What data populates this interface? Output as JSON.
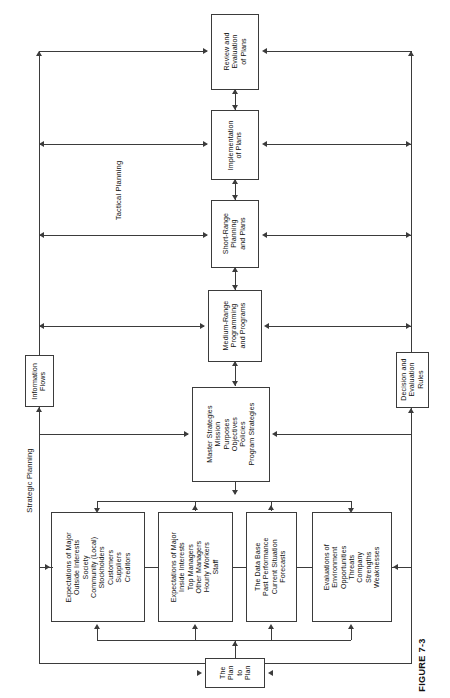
{
  "figure": {
    "caption": "FIGURE 7-3",
    "orientation": "rotated-90",
    "ink_color": "#3b3b3b"
  },
  "section_labels": {
    "tactical": "Tactical Planning",
    "strategic": "Strategic Planning"
  },
  "side_boxes": {
    "information_flows": {
      "lines": [
        "Information",
        "Flows"
      ]
    },
    "decision_rules": {
      "lines": [
        "Decision and",
        "Evaluation",
        "Rules"
      ]
    }
  },
  "spine_boxes": [
    {
      "id": "review-evaluation-of-plans",
      "lines": [
        "Review and",
        "Evaluation",
        "of Plans"
      ]
    },
    {
      "id": "implementation-of-plans",
      "lines": [
        "Implementation",
        "of Plans"
      ]
    },
    {
      "id": "short-range-planning-and-plans",
      "lines": [
        "Short-Range",
        "Planning",
        "and Plans"
      ]
    },
    {
      "id": "medium-range-programming-and-programs",
      "lines": [
        "Medium-Range",
        "Programming",
        "and Programs"
      ]
    },
    {
      "id": "master-strategies",
      "lines": [
        "Master Strategies",
        "Mission",
        "Purposes",
        "Objectives",
        "Policies",
        "Program Strategies"
      ]
    }
  ],
  "input_boxes": [
    {
      "id": "expectations-outside-interests",
      "lines": [
        "Expectations of Major",
        "Outside Interests",
        "Society",
        "Community (Local)",
        "Stockholders",
        "Customers",
        "Suppliers",
        "Creditors"
      ]
    },
    {
      "id": "expectations-inside-interests",
      "lines": [
        "Expectations of Major",
        "Inside Interests",
        "Top Managers",
        "Other Managers",
        "Hourly Workers",
        "Staff"
      ]
    },
    {
      "id": "the-data-base",
      "lines": [
        "The Data Base",
        "Past Performance",
        "Current Situation",
        "Forecasts"
      ]
    },
    {
      "id": "evaluations-of-environment",
      "lines": [
        "Evaluations of",
        "Environment",
        "Opportunities",
        "Threats",
        "Company",
        "Strengths",
        "Weaknesses"
      ]
    }
  ],
  "plan_to_plan": {
    "id": "the-plan-to-plan",
    "lines": [
      "The",
      "Plan",
      "to",
      "Plan"
    ]
  }
}
